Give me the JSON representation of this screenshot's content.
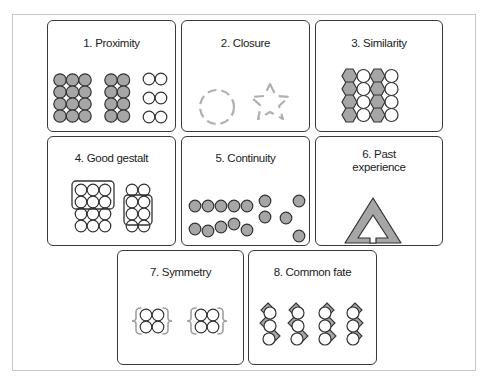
{
  "colors": {
    "border": "#3a3a3a",
    "fill_gray": "#a6a6a6",
    "dash_gray": "#b0b0b0",
    "frame": "#c8c8c8"
  },
  "panels": [
    {
      "id": 1,
      "title": "1. Proximity"
    },
    {
      "id": 2,
      "title": "2. Closure"
    },
    {
      "id": 3,
      "title": "3. Similarity"
    },
    {
      "id": 4,
      "title": "4. Good gestalt"
    },
    {
      "id": 5,
      "title": "5. Continuity"
    },
    {
      "id": 6,
      "title_line1": "6. Past",
      "title_line2": "experience"
    },
    {
      "id": 7,
      "title": "7. Symmetry"
    },
    {
      "id": 8,
      "title": "8. Common fate"
    }
  ]
}
